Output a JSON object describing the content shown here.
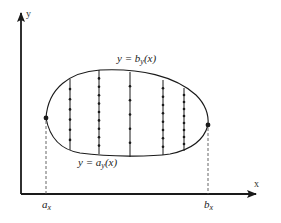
{
  "diagram": {
    "axes": {
      "x_label": "x",
      "y_label": "y"
    },
    "curves": {
      "upper": {
        "label_prefix": "y = b",
        "label_sub": "y",
        "label_suffix": "(x)"
      },
      "lower": {
        "label_prefix": "y = a",
        "label_sub": "y",
        "label_suffix": "(x)"
      }
    },
    "bounds": {
      "left": {
        "label": "a",
        "label_sub": "x"
      },
      "right": {
        "label": "b",
        "label_sub": "x"
      }
    },
    "vertical_segments_count": 5,
    "colors": {
      "stroke": "#1a1a1a",
      "dashed": "#555555",
      "background": "#ffffff"
    }
  }
}
